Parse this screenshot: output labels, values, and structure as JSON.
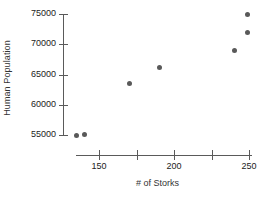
{
  "chart_data": {
    "type": "scatter",
    "title": "",
    "xlabel": "# of Storks",
    "ylabel": "Human Population",
    "xlim": [
      128,
      256
    ],
    "ylim": [
      53500,
      76500
    ],
    "grid": false,
    "legend": null,
    "marker_color": "#595959",
    "axis_color": "#5a5a5a",
    "x_ticks": [
      {
        "value": 150,
        "label": "150"
      },
      {
        "value": 175,
        "label": ""
      },
      {
        "value": 200,
        "label": "200"
      },
      {
        "value": 225,
        "label": ""
      },
      {
        "value": 250,
        "label": "250"
      }
    ],
    "y_ticks": [
      {
        "value": 55000,
        "label": "55000"
      },
      {
        "value": 60000,
        "label": "60000"
      },
      {
        "value": 65000,
        "label": "65000"
      },
      {
        "value": 70000,
        "label": "70000"
      },
      {
        "value": 75000,
        "label": "75000"
      }
    ],
    "points": [
      {
        "x": 135,
        "y": 55000
      },
      {
        "x": 140,
        "y": 55100
      },
      {
        "x": 170,
        "y": 63500
      },
      {
        "x": 190,
        "y": 66200
      },
      {
        "x": 240,
        "y": 69000
      },
      {
        "x": 249,
        "y": 72000
      },
      {
        "x": 249,
        "y": 75000
      }
    ]
  }
}
